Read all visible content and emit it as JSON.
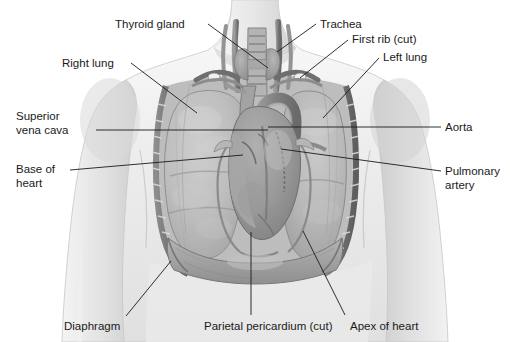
{
  "figure": {
    "background_color": "#ffffff",
    "text_color": "#1a1a1a",
    "leader_color": "#1a1a1a"
  },
  "labels": [
    {
      "id": "thyroid-gland",
      "text": "Thyroid gland",
      "x": 115,
      "y": 18,
      "align": "left"
    },
    {
      "id": "trachea",
      "text": "Trachea",
      "x": 320,
      "y": 18,
      "align": "left"
    },
    {
      "id": "first-rib-cut",
      "text": "First rib (cut)",
      "x": 352,
      "y": 33,
      "align": "left"
    },
    {
      "id": "right-lung",
      "text": "Right lung",
      "x": 62,
      "y": 57,
      "align": "left"
    },
    {
      "id": "left-lung",
      "text": "Left lung",
      "x": 383,
      "y": 51,
      "align": "left"
    },
    {
      "id": "superior-vena-cava",
      "text": "Superior\nvena cava",
      "x": 16,
      "y": 110,
      "align": "left"
    },
    {
      "id": "aorta",
      "text": "Aorta",
      "x": 445,
      "y": 121,
      "align": "left"
    },
    {
      "id": "base-of-heart",
      "text": "Base of\nheart",
      "x": 16,
      "y": 163,
      "align": "left"
    },
    {
      "id": "pulmonary-artery",
      "text": "Pulmonary\nartery",
      "x": 445,
      "y": 165,
      "align": "left"
    },
    {
      "id": "diaphragm",
      "text": "Diaphragm",
      "x": 64,
      "y": 320,
      "align": "left"
    },
    {
      "id": "parietal-pericardium",
      "text": "Parietal pericardium (cut)",
      "x": 204,
      "y": 320,
      "align": "left"
    },
    {
      "id": "apex-of-heart",
      "text": "Apex of heart",
      "x": 350,
      "y": 320,
      "align": "left"
    }
  ],
  "leader_lines": [
    {
      "id": "leader-thyroid-gland",
      "points": "208,24 268,68"
    },
    {
      "id": "leader-trachea",
      "points": "316,24 277,52"
    },
    {
      "id": "leader-first-rib-cut",
      "points": "348,40 300,78"
    },
    {
      "id": "leader-right-lung",
      "points": "131,63 197,113"
    },
    {
      "id": "leader-left-lung",
      "points": "379,58 323,118"
    },
    {
      "id": "leader-superior-vena-cava",
      "points": "96,130 268,130"
    },
    {
      "id": "leader-aorta",
      "points": "441,127 268,127"
    },
    {
      "id": "leader-base-of-heart",
      "points": "70,170 243,155"
    },
    {
      "id": "leader-pulmonary-artery",
      "points": "441,171 281,149"
    },
    {
      "id": "leader-diaphragm",
      "points": "126,316 171,261"
    },
    {
      "id": "leader-parietal-pericardium",
      "points": "251,315 251,232"
    },
    {
      "id": "leader-apex-of-heart",
      "points": "345,315 303,231"
    }
  ],
  "anatomy": {
    "regions": [
      {
        "id": "neck",
        "name": "neck"
      },
      {
        "id": "left-shoulder",
        "name": "shoulder-left"
      },
      {
        "id": "right-shoulder",
        "name": "shoulder-right"
      },
      {
        "id": "torso",
        "name": "torso"
      },
      {
        "id": "right-lung-region",
        "name": "right-lung"
      },
      {
        "id": "left-lung-region",
        "name": "left-lung"
      },
      {
        "id": "heart-region",
        "name": "heart"
      },
      {
        "id": "trachea-region",
        "name": "trachea"
      },
      {
        "id": "thyroid-region",
        "name": "thyroid-gland"
      },
      {
        "id": "diaphragm-region",
        "name": "diaphragm"
      },
      {
        "id": "ribcage-region",
        "name": "cut-rib-margin"
      },
      {
        "id": "aorta-region",
        "name": "aortic-arch"
      },
      {
        "id": "svc-region",
        "name": "superior-vena-cava"
      }
    ]
  }
}
